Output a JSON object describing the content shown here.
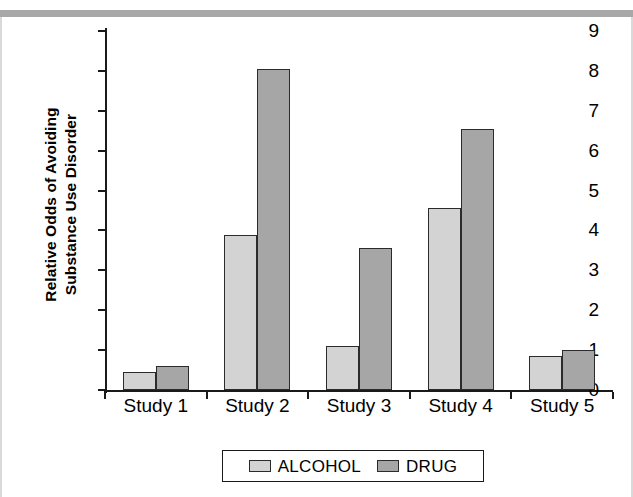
{
  "chart_data": {
    "type": "bar",
    "title": "",
    "xlabel": "",
    "ylabel": "Relative Odds of Avoiding Substance Use Disorder",
    "ylabel_line1": "Relative Odds of Avoiding",
    "ylabel_line2": "Substance Use Disorder",
    "categories": [
      "Study 1",
      "Study 2",
      "Study 3",
      "Study 4",
      "Study 5"
    ],
    "series": [
      {
        "name": "ALCOHOL",
        "color": "#d3d3d3",
        "values": [
          0.45,
          3.88,
          1.1,
          4.57,
          0.85
        ]
      },
      {
        "name": "DRUG",
        "color": "#a6a6a6",
        "values": [
          0.6,
          8.05,
          3.57,
          6.55,
          1.0
        ]
      }
    ],
    "ylim": [
      0,
      9
    ],
    "yticks": [
      0,
      1,
      2,
      3,
      4,
      5,
      6,
      7,
      8,
      9
    ],
    "ytick_labels": [
      "0",
      "1",
      "2",
      "3",
      "4",
      "5",
      "6",
      "7",
      "8",
      "9"
    ],
    "grid": false,
    "legend_position": "bottom-center"
  },
  "legend": {
    "entries": [
      {
        "label": "ALCOHOL",
        "color": "#d3d3d3"
      },
      {
        "label": "DRUG",
        "color": "#a6a6a6"
      }
    ]
  },
  "colors": {
    "alcohol": "#d3d3d3",
    "drug": "#a6a6a6",
    "axis": "#1a1a1a",
    "text": "#000000",
    "scanbar": "#a8a8a8"
  }
}
